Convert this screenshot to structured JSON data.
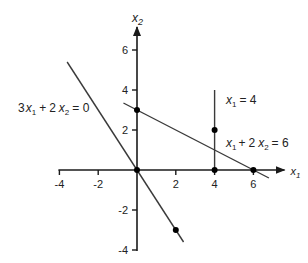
{
  "diagram": {
    "type": "linear-equations-plot",
    "axes": {
      "x": {
        "name": "x",
        "subscript": "1",
        "range": [
          -4,
          7.5
        ],
        "ticks": [
          -4,
          -2,
          2,
          4,
          6
        ]
      },
      "y": {
        "name": "x",
        "subscript": "2",
        "range": [
          -4,
          7
        ],
        "ticks": [
          6,
          4,
          2,
          -2,
          -4
        ]
      }
    },
    "lines": [
      {
        "id": "eq-3x1-2x2-0",
        "label": {
          "coef1": "3",
          "var1": "x",
          "sub1": "1",
          "op": "+",
          "coef2": "2",
          "var2": "x",
          "sub2": "2",
          "rhs": "= 0"
        },
        "from": [
          -3.6,
          5.4
        ],
        "to": [
          2.4,
          -3.6
        ]
      },
      {
        "id": "eq-x1-2x2-6",
        "label": {
          "coef1": "",
          "var1": "x",
          "sub1": "1",
          "op": "+",
          "coef2": "2",
          "var2": "x",
          "sub2": "2",
          "rhs": "= 6"
        },
        "from": [
          -0.7,
          3.35
        ],
        "to": [
          6.8,
          -0.4
        ]
      },
      {
        "id": "eq-x1-4",
        "label": {
          "var1": "x",
          "sub1": "1",
          "rhs": "= 4"
        },
        "from": [
          4,
          4
        ],
        "to": [
          4,
          0
        ]
      }
    ],
    "points": [
      {
        "x": 0,
        "y": 3
      },
      {
        "x": 0,
        "y": 0
      },
      {
        "x": 4,
        "y": 2
      },
      {
        "x": 4,
        "y": 0
      },
      {
        "x": 6,
        "y": 0
      },
      {
        "x": 2,
        "y": -3
      }
    ]
  }
}
